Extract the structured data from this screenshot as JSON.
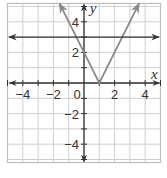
{
  "chart_data": {
    "type": "line",
    "title": "",
    "xlabel": "x",
    "ylabel": "y",
    "xlim": [
      -5,
      5
    ],
    "ylim": [
      -5.2,
      5.2
    ],
    "grid": true,
    "legend": null,
    "x_ticks": [
      -4,
      -2,
      0,
      2,
      4
    ],
    "x_tick_labels": [
      "−4",
      "−2",
      "0",
      "2",
      "4"
    ],
    "y_ticks": [
      -4,
      -2,
      2,
      4
    ],
    "y_tick_labels": [
      "−4",
      "−2",
      "2",
      "4"
    ],
    "origin_label": "0",
    "series": [
      {
        "name": "y = 2|x − 1|",
        "kind": "absolute-value",
        "color": "#8a8a8a",
        "points": [
          [
            -1.6,
            5.2
          ],
          [
            1,
            0
          ],
          [
            3.6,
            5.2
          ]
        ],
        "arrows": "both-ends"
      },
      {
        "name": "y = 3",
        "kind": "horizontal-line",
        "color": "#333333",
        "points": [
          [
            -4.9,
            3
          ],
          [
            4.9,
            3
          ]
        ],
        "arrows": "both-ends"
      }
    ]
  },
  "colors": {
    "grid": "#cfcfcf",
    "border": "#bdbdbd",
    "axis": "#333333",
    "v_graph": "#8a8a8a",
    "horizontal_line": "#333333"
  }
}
